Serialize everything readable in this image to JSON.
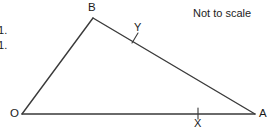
{
  "figure": {
    "background_color": "#ffffff",
    "stroke_color": "#3a3a3a",
    "text_color": "#1a1a1a",
    "note": "Not to scale",
    "vertices": [
      {
        "id": "B",
        "label": "B",
        "x": 93,
        "y": 18
      },
      {
        "id": "O",
        "label": "O",
        "x": 22,
        "y": 114
      },
      {
        "id": "A",
        "label": "A",
        "x": 255,
        "y": 114
      }
    ],
    "points": [
      {
        "id": "X",
        "label": "X",
        "x": 198,
        "y": 114,
        "tick": true
      },
      {
        "id": "Y",
        "label": "Y",
        "x": 135,
        "y": 38,
        "tick": true
      }
    ],
    "sides": [
      {
        "from": "O",
        "to": "B"
      },
      {
        "from": "B",
        "to": "A"
      },
      {
        "from": "O",
        "to": "A"
      }
    ],
    "ratio_text": [
      ": 1.",
      ": 1."
    ]
  }
}
